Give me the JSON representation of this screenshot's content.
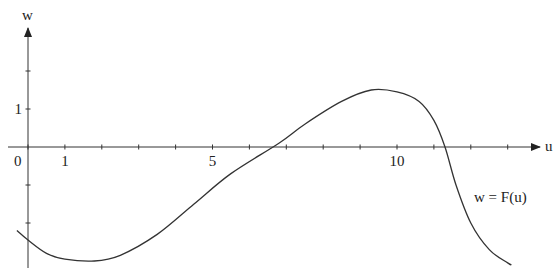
{
  "chart_data": {
    "type": "line",
    "title": "",
    "xlabel": "u",
    "ylabel": "w",
    "curve_label": "w = F(u)",
    "x_tick_labels": [
      "0",
      "1",
      "5",
      "10"
    ],
    "x_tick_positions": [
      0,
      1,
      5,
      10
    ],
    "x_ticks": [
      0,
      1,
      2,
      3,
      4,
      5,
      6,
      7,
      8,
      9,
      10,
      11,
      12,
      13
    ],
    "y_tick_labels": [
      "1"
    ],
    "y_ticks": [
      -2,
      -1,
      1,
      2
    ],
    "xlim": [
      -0.3,
      13.7
    ],
    "ylim": [
      -3.1,
      3.1
    ],
    "grid": false,
    "legend": "none",
    "series": [
      {
        "name": "w = F(u)",
        "x": [
          -0.3,
          0,
          0.5,
          1,
          1.8,
          2.5,
          3.5,
          4.5,
          5.5,
          6.8,
          7.5,
          8.5,
          9.3,
          10,
          10.6,
          11,
          11.3,
          11.6,
          12,
          12.5,
          13,
          13.1
        ],
        "y": [
          -2.2,
          -2.45,
          -2.8,
          -2.95,
          -3.0,
          -2.85,
          -2.3,
          -1.5,
          -0.7,
          0.1,
          0.6,
          1.2,
          1.5,
          1.45,
          1.2,
          0.7,
          0.0,
          -1.0,
          -2.0,
          -2.7,
          -3.05,
          -3.1
        ]
      }
    ]
  }
}
